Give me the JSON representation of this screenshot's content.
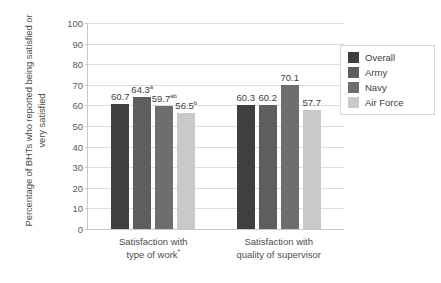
{
  "chart_data": {
    "type": "bar",
    "title": "",
    "xlabel": "",
    "ylabel": "Percentage of BHTs who reported being satisfied or very satisfied",
    "ylim": [
      0,
      100
    ],
    "ytick_step": 10,
    "yticks": [
      "100",
      "90",
      "80",
      "70",
      "60",
      "50",
      "40",
      "30",
      "20",
      "10",
      "0"
    ],
    "grid": true,
    "legend_position": "right",
    "categories": [
      "Satisfaction with type of work*",
      "Satisfaction with quality of supervisor"
    ],
    "category_lines": [
      [
        "Satisfaction with",
        "type of work*"
      ],
      [
        "Satisfaction with",
        "quality of supervisor"
      ]
    ],
    "series": [
      {
        "name": "Overall",
        "color": "#3f3f3f",
        "values": [
          60.7,
          60.3
        ]
      },
      {
        "name": "Army",
        "color": "#5e5e5e",
        "values": [
          64.3,
          60.2
        ]
      },
      {
        "name": "Navy",
        "color": "#6e6e6e",
        "values": [
          59.7,
          70.1
        ]
      },
      {
        "name": "Air Force",
        "color": "#c9c9c9",
        "values": [
          56.5,
          57.7
        ]
      }
    ],
    "data_labels": [
      [
        {
          "value": "60.7",
          "sup": ""
        },
        {
          "value": "64.3",
          "sup": "a"
        },
        {
          "value": "59.7",
          "sup": "ab"
        },
        {
          "value": "56.5",
          "sup": "b"
        }
      ],
      [
        {
          "value": "60.3",
          "sup": ""
        },
        {
          "value": "60.2",
          "sup": ""
        },
        {
          "value": "70.1",
          "sup": ""
        },
        {
          "value": "57.7",
          "sup": ""
        }
      ]
    ]
  },
  "legend": {
    "items": [
      {
        "label": "Overall",
        "color": "#3f3f3f"
      },
      {
        "label": "Army",
        "color": "#5e5e5e"
      },
      {
        "label": "Navy",
        "color": "#6e6e6e"
      },
      {
        "label": "Air Force",
        "color": "#c9c9c9"
      }
    ]
  }
}
